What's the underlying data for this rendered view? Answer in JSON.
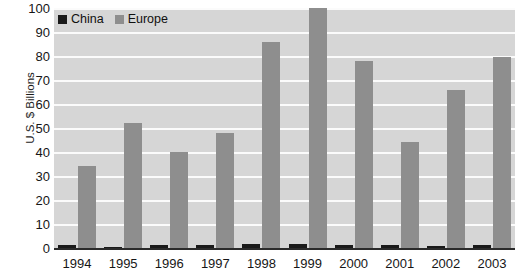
{
  "chart_data": {
    "type": "bar",
    "title": "",
    "xlabel": "",
    "ylabel": "U.S. $ Billions",
    "ylim": [
      0,
      100
    ],
    "ytick_labels": [
      "100",
      "90",
      "80",
      "70",
      "60",
      "50",
      "40",
      "30",
      "20",
      "10",
      "0"
    ],
    "ytick_values": [
      100,
      90,
      80,
      70,
      60,
      50,
      40,
      30,
      20,
      10,
      0
    ],
    "grid": true,
    "grid_color": "#fbfbfb",
    "plot_background": "#d6d6d6",
    "legend_position": "top-left-inside",
    "categories": [
      "1994",
      "1995",
      "1996",
      "1997",
      "1998",
      "1999",
      "2000",
      "2001",
      "2002",
      "2003"
    ],
    "series": [
      {
        "name": "China",
        "color": "#1a1a1a",
        "values": [
          1.2,
          0.5,
          1.2,
          1.3,
          1.6,
          1.5,
          1.4,
          1.1,
          1.0,
          1.2
        ]
      },
      {
        "name": "Europe",
        "color": "#8e8e8e",
        "values": [
          34,
          52,
          40,
          48,
          86,
          100,
          78,
          44,
          66,
          79.5
        ]
      }
    ]
  },
  "legend": {
    "entries": [
      {
        "label": "China",
        "color": "#1a1a1a"
      },
      {
        "label": "Europe",
        "color": "#8e8e8e"
      }
    ]
  }
}
